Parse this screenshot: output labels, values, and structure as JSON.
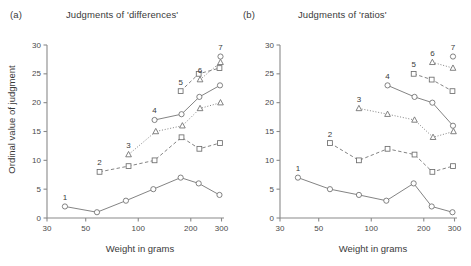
{
  "figure": {
    "xlabel": "Weight in grams",
    "ylabel": "Ordinal value of judgment"
  },
  "panels": [
    {
      "tag": "(a)",
      "title": "Judgments of 'differences'"
    },
    {
      "tag": "(b)",
      "title": "Judgments of 'ratios'"
    }
  ],
  "axes": {
    "x_ticks": [
      "30",
      "50",
      "100",
      "200",
      "300"
    ],
    "y_ticks": [
      "0",
      "5",
      "10",
      "15",
      "20",
      "25",
      "30"
    ]
  },
  "colors": {
    "axis": "#8a8a8a",
    "line": "#6d6d6d",
    "marker_fill": "#ffffff",
    "text": "#3a3a3a"
  },
  "chart_data": [
    {
      "type": "line",
      "title": "Judgments of 'differences'",
      "panel": "(a)",
      "xlabel": "Weight in grams",
      "ylabel": "Ordinal value of judgment",
      "xscale": "log",
      "xlim": [
        30,
        310
      ],
      "ylim": [
        0,
        30
      ],
      "xticks": [
        30,
        50,
        100,
        200,
        300
      ],
      "yticks": [
        0,
        5,
        10,
        15,
        20,
        25,
        30
      ],
      "grid": false,
      "legend": "none",
      "annotations": [
        "1",
        "2",
        "3",
        "4",
        "5",
        "6",
        "7"
      ],
      "series": [
        {
          "name": "1",
          "marker": "circle",
          "dash": "solid",
          "x": [
            38,
            58,
            85,
            122,
            175,
            222,
            292
          ],
          "y": [
            2,
            1,
            3,
            5,
            7,
            6,
            4
          ],
          "label": "1",
          "label_x": 38,
          "label_y": 2
        },
        {
          "name": "2",
          "marker": "square",
          "dash": "dashed",
          "x": [
            60,
            88,
            124,
            177,
            224,
            294
          ],
          "y": [
            8,
            9,
            10,
            14,
            12,
            13
          ],
          "label": "2",
          "label_x": 60,
          "label_y": 8
        },
        {
          "name": "3",
          "marker": "triangle",
          "dash": "dotted",
          "x": [
            88,
            126,
            179,
            226,
            296
          ],
          "y": [
            11,
            15,
            16,
            19,
            20
          ],
          "label": "3",
          "label_x": 88,
          "label_y": 11
        },
        {
          "name": "4",
          "marker": "circle",
          "dash": "solid",
          "x": [
            124,
            177,
            224,
            294
          ],
          "y": [
            17,
            18,
            21,
            23
          ],
          "label": "4",
          "label_x": 124,
          "label_y": 17
        },
        {
          "name": "5",
          "marker": "square",
          "dash": "dashed",
          "x": [
            175,
            222,
            292
          ],
          "y": [
            22,
            25,
            26
          ],
          "label": "5",
          "label_x": 175,
          "label_y": 22
        },
        {
          "name": "6",
          "marker": "triangle",
          "dash": "dotted",
          "x": [
            226,
            296
          ],
          "y": [
            24,
            27
          ],
          "label": "6",
          "label_x": 226,
          "label_y": 24
        },
        {
          "name": "7",
          "marker": "circle",
          "dash": "none",
          "x": [
            296
          ],
          "y": [
            28
          ],
          "label": "7",
          "label_x": 296,
          "label_y": 28
        }
      ]
    },
    {
      "type": "line",
      "title": "Judgments of 'ratios'",
      "panel": "(b)",
      "xlabel": "Weight in grams",
      "ylabel": "Ordinal value of judgment",
      "xscale": "log",
      "xlim": [
        30,
        310
      ],
      "ylim": [
        0,
        30
      ],
      "xticks": [
        30,
        50,
        100,
        200,
        300
      ],
      "yticks": [
        0,
        5,
        10,
        15,
        20,
        25,
        30
      ],
      "grid": false,
      "legend": "none",
      "annotations": [
        "1",
        "2",
        "3",
        "4",
        "5",
        "6",
        "7"
      ],
      "series": [
        {
          "name": "1",
          "marker": "circle",
          "dash": "solid",
          "x": [
            38,
            58,
            85,
            122,
            175,
            222,
            292
          ],
          "y": [
            7,
            5,
            4,
            3,
            6,
            2,
            1
          ],
          "label": "1",
          "label_x": 38,
          "label_y": 7
        },
        {
          "name": "2",
          "marker": "square",
          "dash": "dashed",
          "x": [
            58,
            85,
            124,
            177,
            224,
            294
          ],
          "y": [
            13,
            10,
            12,
            11,
            8,
            9
          ],
          "label": "2",
          "label_x": 58,
          "label_y": 13
        },
        {
          "name": "3",
          "marker": "triangle",
          "dash": "dotted",
          "x": [
            85,
            124,
            177,
            226,
            296
          ],
          "y": [
            19,
            18,
            17,
            14,
            15
          ],
          "label": "3",
          "label_x": 85,
          "label_y": 19
        },
        {
          "name": "4",
          "marker": "circle",
          "dash": "solid",
          "x": [
            124,
            177,
            224,
            294
          ],
          "y": [
            23,
            21,
            20,
            16
          ],
          "label": "4",
          "label_x": 124,
          "label_y": 23
        },
        {
          "name": "5",
          "marker": "square",
          "dash": "dashed",
          "x": [
            175,
            222,
            292
          ],
          "y": [
            25,
            24,
            22
          ],
          "label": "5",
          "label_x": 175,
          "label_y": 25
        },
        {
          "name": "6",
          "marker": "triangle",
          "dash": "dotted",
          "x": [
            224,
            294
          ],
          "y": [
            27,
            26
          ],
          "label": "6",
          "label_x": 224,
          "label_y": 27
        },
        {
          "name": "7",
          "marker": "circle",
          "dash": "none",
          "x": [
            294
          ],
          "y": [
            28
          ],
          "label": "7",
          "label_x": 294,
          "label_y": 28
        }
      ]
    }
  ]
}
